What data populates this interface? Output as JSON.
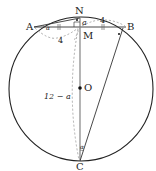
{
  "diagram": {
    "type": "circle-geometry",
    "circle": {
      "center_label": "O",
      "cx": 81,
      "cy": 89,
      "r": 72
    },
    "points": {
      "A": {
        "label": "A",
        "x": 34,
        "y": 27
      },
      "B": {
        "label": "B",
        "x": 126,
        "y": 27
      },
      "N": {
        "label": "N",
        "x": 80,
        "y": 17
      },
      "M": {
        "label": "M",
        "x": 80,
        "y": 27
      },
      "O": {
        "label": "O",
        "x": 80,
        "y": 88
      },
      "C": {
        "label": "C",
        "x": 80,
        "y": 161
      }
    },
    "segment_labels": {
      "NM": "a",
      "AM": "4",
      "MB": "4",
      "MC": "12 − a"
    },
    "angle_labels": {
      "at_A": "α",
      "at_C": "α"
    },
    "colors": {
      "stroke": "#222222",
      "dashed": "#888888",
      "label": "#222222"
    }
  }
}
